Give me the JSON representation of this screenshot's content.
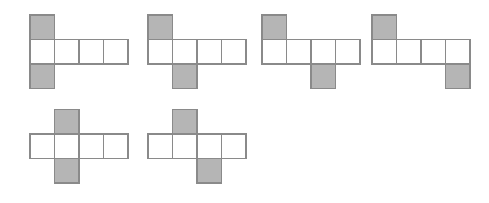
{
  "image": {
    "title": "Cube net diagrams",
    "description": "Six hexomino cube nets, each a horizontal strip of four squares with one shaded square attached above and one shaded square attached below",
    "width": 489,
    "height": 203,
    "background_color": "#ffffff"
  },
  "style": {
    "cell_size": 24.5,
    "shaded_fill": "#b5b5b5",
    "unshaded_fill": "#ffffff",
    "stroke_color": "#8a8a8a",
    "stroke_width": 1.1
  },
  "figures": [
    {
      "id": "net-1",
      "label": "Net 1",
      "origin_x": 30,
      "origin_y": 39.5,
      "row_length": 4,
      "top_square_column": 0,
      "bottom_square_column": 0,
      "shaded_columns_top": [
        0
      ],
      "shaded_columns_bottom": [
        0
      ]
    },
    {
      "id": "net-2",
      "label": "Net 2",
      "origin_x": 148,
      "origin_y": 39.5,
      "row_length": 4,
      "top_square_column": 0,
      "bottom_square_column": 1,
      "shaded_columns_top": [
        0
      ],
      "shaded_columns_bottom": [
        1
      ]
    },
    {
      "id": "net-3",
      "label": "Net 3",
      "origin_x": 262,
      "origin_y": 39.5,
      "row_length": 4,
      "top_square_column": 0,
      "bottom_square_column": 2,
      "shaded_columns_top": [
        0
      ],
      "shaded_columns_bottom": [
        2
      ]
    },
    {
      "id": "net-4",
      "label": "Net 4",
      "origin_x": 372,
      "origin_y": 39.5,
      "row_length": 4,
      "top_square_column": 0,
      "bottom_square_column": 3,
      "shaded_columns_top": [
        0
      ],
      "shaded_columns_bottom": [
        3
      ]
    },
    {
      "id": "net-5",
      "label": "Net 5",
      "origin_x": 30,
      "origin_y": 134,
      "row_length": 4,
      "top_square_column": 1,
      "bottom_square_column": 1,
      "shaded_columns_top": [
        1
      ],
      "shaded_columns_bottom": [
        1
      ]
    },
    {
      "id": "net-6",
      "label": "Net 6",
      "origin_x": 148,
      "origin_y": 134,
      "row_length": 4,
      "top_square_column": 1,
      "bottom_square_column": 2,
      "shaded_columns_top": [
        1
      ],
      "shaded_columns_bottom": [
        2
      ]
    }
  ]
}
